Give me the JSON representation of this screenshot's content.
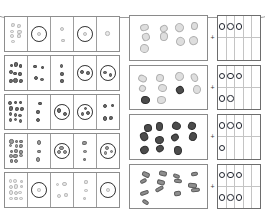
{
  "document": {
    "title": "Counting worksheet scan",
    "background_color": "#ffffff"
  },
  "top_shape": {
    "name": "rounded-rectangle-outline",
    "stroke_color": "#9a9a9a",
    "note": "large rounded rectangle arcing across top, clipped by page edge"
  },
  "left_grid": {
    "rows": 5,
    "columns": 5,
    "border_color": "#8d8d8d",
    "cells": [
      [
        {
          "kind": "dot-cluster",
          "count": 7,
          "style": "pale"
        },
        {
          "kind": "ring-with-dots",
          "ring": true,
          "count": 1,
          "style": "pale"
        },
        {
          "kind": "dot-cluster",
          "count": 2,
          "style": "pale"
        },
        {
          "kind": "ring-with-dots",
          "ring": true,
          "count": 1,
          "style": "pale"
        },
        {
          "kind": "dot-cluster",
          "count": 1,
          "style": "pale"
        }
      ],
      [
        {
          "kind": "dot-cluster",
          "count": 9,
          "style": "dark"
        },
        {
          "kind": "dot-cluster",
          "count": 4,
          "style": "dark"
        },
        {
          "kind": "dot-cluster",
          "count": 3,
          "style": "dark"
        },
        {
          "kind": "ring-with-dots",
          "ring": true,
          "count": 2,
          "style": "dark"
        },
        {
          "kind": "ring-with-dots",
          "ring": true,
          "count": 2,
          "style": "dark"
        }
      ],
      [
        {
          "kind": "dot-cluster",
          "count": 12,
          "style": "dark"
        },
        {
          "kind": "dot-cluster",
          "count": 3,
          "style": "dark"
        },
        {
          "kind": "ring-with-dots",
          "ring": true,
          "count": 2,
          "style": "dark"
        },
        {
          "kind": "ring-with-dots",
          "ring": true,
          "count": 3,
          "style": "dark"
        },
        {
          "kind": "dot-cluster",
          "count": 4,
          "style": "dark"
        }
      ],
      [
        {
          "kind": "dot-cluster",
          "count": 14,
          "style": "mid"
        },
        {
          "kind": "dot-cluster",
          "count": 3,
          "style": "mid"
        },
        {
          "kind": "ring-with-dots",
          "ring": true,
          "count": 3,
          "style": "mid"
        },
        {
          "kind": "dot-cluster",
          "count": 3,
          "style": "mid"
        },
        {
          "kind": "ring-with-dots",
          "ring": true,
          "count": 3,
          "style": "mid"
        }
      ],
      [
        {
          "kind": "dot-cluster",
          "count": 12,
          "style": "pale"
        },
        {
          "kind": "ring-with-dots",
          "ring": true,
          "count": 1,
          "style": "pale"
        },
        {
          "kind": "dot-cluster",
          "count": 4,
          "style": "pale"
        },
        {
          "kind": "dot-cluster",
          "count": 3,
          "style": "pale"
        },
        {
          "kind": "ring-with-dots",
          "ring": true,
          "count": 1,
          "style": "pale"
        }
      ]
    ]
  },
  "right_panels": [
    {
      "name": "panel-cats",
      "scatter": {
        "sprite": "cat-figure",
        "count": 9,
        "style": "pale"
      },
      "separator": "+",
      "tenframe": {
        "rows": 2,
        "cols": 5,
        "filled": 3,
        "row_counts": [
          3,
          0
        ]
      }
    },
    {
      "name": "panel-chickens",
      "scatter": {
        "sprite": "chicken-figure",
        "count": 10,
        "style": "pale-and-dark"
      },
      "separator": "+",
      "tenframe": {
        "rows": 2,
        "cols": 5,
        "filled": 5,
        "row_counts": [
          3,
          2
        ]
      }
    },
    {
      "name": "panel-bugs",
      "scatter": {
        "sprite": "bug-figure",
        "count": 11,
        "style": "dark"
      },
      "separator": "+",
      "tenframe": {
        "rows": 2,
        "cols": 5,
        "filled": 4,
        "row_counts": [
          3,
          1
        ]
      }
    },
    {
      "name": "panel-mice",
      "scatter": {
        "sprite": "mouse-figure",
        "count": 13,
        "style": "mid"
      },
      "separator": "+",
      "tenframe": {
        "rows": 2,
        "cols": 5,
        "filled": 6,
        "row_counts": [
          3,
          3
        ]
      }
    }
  ],
  "colors": {
    "grid_border": "#8d8d8d",
    "cell_divider": "#9e9e9e",
    "ring_stroke": "#2e2e2e",
    "tenframe_border": "#6d6d6d",
    "tenframe_circle": "#20242e",
    "dot_pale": "#e8e8e8",
    "dot_dark": "#6e6e6e",
    "dot_mid": "#9c9c9c"
  }
}
